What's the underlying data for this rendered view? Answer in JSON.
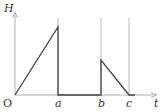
{
  "diagram": {
    "y_axis_label": "H",
    "x_axis_label": "t",
    "origin_label": "O",
    "tick_labels": [
      "a",
      "b",
      "c"
    ],
    "colors": {
      "axis": "#b0b0b0",
      "guide": "#b8b8b8",
      "curve": "#444444",
      "text": "#333333"
    },
    "segments": [
      {
        "from": "O",
        "to": "a",
        "shape": "linear rise from 0 to peak"
      },
      {
        "at": "a",
        "shape": "vertical drop to 0"
      },
      {
        "from": "a",
        "to": "b",
        "shape": "zero"
      },
      {
        "at": "b",
        "shape": "vertical jump to lower peak"
      },
      {
        "from": "b",
        "to": "c",
        "shape": "linear decrease to 0"
      }
    ]
  }
}
